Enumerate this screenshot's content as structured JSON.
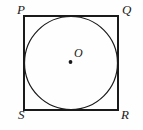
{
  "figure": {
    "background_color": "#fefefe",
    "stroke_color": "#1a1a1a",
    "label_color": "#1a1a1a",
    "square": {
      "name": "PQRS",
      "x": 24,
      "y": 16,
      "width": 94,
      "height": 94,
      "stroke_width": 1.2,
      "fill": "none"
    },
    "circle": {
      "center_x": 71,
      "center_y": 63,
      "radius": 46.5,
      "stroke_width": 1.2,
      "fill": "none",
      "relation": "inscribed"
    },
    "center_point": {
      "x": 70.5,
      "y": 62,
      "radius": 1.9,
      "fill": "#1a1a1a"
    },
    "labels": {
      "top_left": "P",
      "top_right": "Q",
      "bottom_right": "R",
      "bottom_left": "S",
      "center": "O"
    }
  }
}
